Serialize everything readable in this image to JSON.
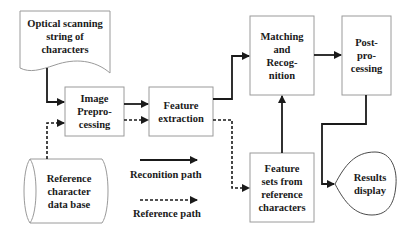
{
  "diagram": {
    "nodes": {
      "optical_scanning": {
        "label": "Optical scanning\nstring of\ncharacters",
        "shape": "document"
      },
      "image_preprocessing": {
        "label": "Image\nPrepro-\ncessing",
        "shape": "rectangle"
      },
      "feature_extraction": {
        "label": "Feature\nextraction",
        "shape": "rectangle"
      },
      "matching_recognition": {
        "label": "Matching\nand\nRecog-\nnition",
        "shape": "rectangle"
      },
      "post_processing": {
        "label": "Post-\npro-\ncessing",
        "shape": "rectangle"
      },
      "reference_database": {
        "label": "Reference\ncharacter\ndata base",
        "shape": "cylinder"
      },
      "feature_sets_reference": {
        "label": "Feature\nsets from\nreference\ncharacters",
        "shape": "rectangle"
      },
      "results_display": {
        "label": "Results\ndisplay",
        "shape": "display"
      }
    },
    "edges": [
      {
        "from": "optical_scanning",
        "to": "image_preprocessing",
        "style": "solid"
      },
      {
        "from": "image_preprocessing",
        "to": "feature_extraction",
        "style": "solid"
      },
      {
        "from": "feature_extraction",
        "to": "matching_recognition",
        "style": "solid"
      },
      {
        "from": "matching_recognition",
        "to": "post_processing",
        "style": "solid"
      },
      {
        "from": "post_processing",
        "to": "results_display",
        "style": "solid"
      },
      {
        "from": "feature_sets_reference",
        "to": "matching_recognition",
        "style": "solid"
      },
      {
        "from": "reference_database",
        "to": "image_preprocessing",
        "style": "dashed"
      },
      {
        "from": "image_preprocessing",
        "to": "feature_extraction",
        "style": "dashed"
      },
      {
        "from": "feature_extraction",
        "to": "feature_sets_reference",
        "style": "dashed"
      }
    ],
    "legend": {
      "recognition_path": "Reconition path",
      "reference_path": "Reference path"
    },
    "colors": {
      "line": "#1a1a1a",
      "box_border": "#9a9a9a",
      "text": "#1a1a1a"
    }
  }
}
